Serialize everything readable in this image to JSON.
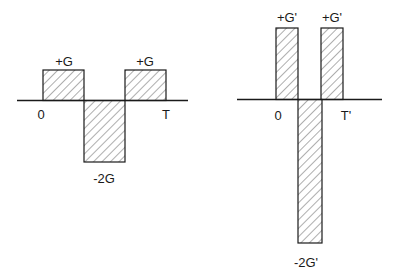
{
  "left_diagram": {
    "labels": {
      "pos1": "+G",
      "pos2": "+G",
      "neg": "-2G",
      "start": "0",
      "end": "T"
    },
    "pulses": [
      {
        "amplitude": 1,
        "label": "+G"
      },
      {
        "amplitude": -2,
        "label": "-2G"
      },
      {
        "amplitude": 1,
        "label": "+G"
      }
    ]
  },
  "right_diagram": {
    "labels": {
      "pos1": "+G'",
      "pos2": "+G'",
      "neg": "-2G'",
      "start": "0",
      "end": "T'"
    },
    "pulses": [
      {
        "amplitude": 1,
        "label": "+G'"
      },
      {
        "amplitude": -2,
        "label": "-2G'"
      },
      {
        "amplitude": 1,
        "label": "+G'"
      }
    ]
  },
  "colors": {
    "stroke": "#1a1a1a",
    "hatch": "#333333",
    "background": "#ffffff"
  }
}
